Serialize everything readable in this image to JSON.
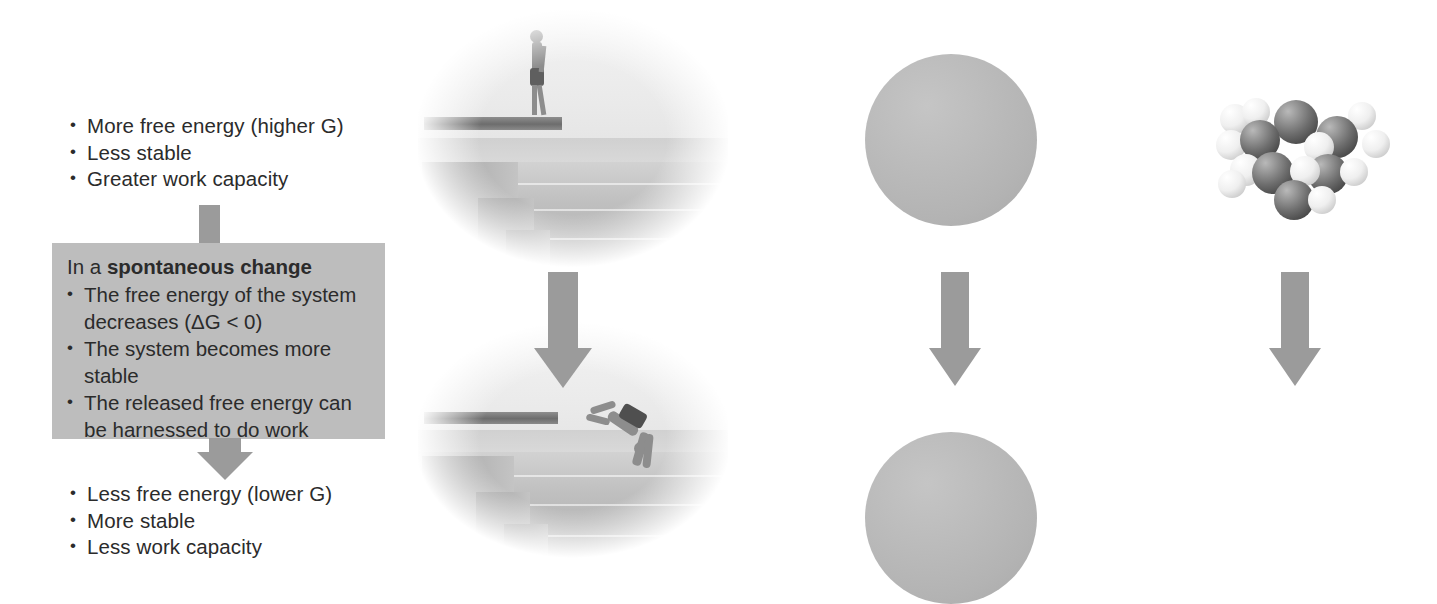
{
  "figure": {
    "colors": {
      "box_fill": "#bdbdbd",
      "arrow_gray": "#9b9b9b",
      "text": "#2b2b2b",
      "particle_dark": "#4e4e4e",
      "carbon_atom": "#2e2e2e",
      "hydrogen_atom": "#ffffff"
    }
  },
  "text_column": {
    "top_list": [
      "More free energy (higher G)",
      "Less stable",
      "Greater work capacity"
    ],
    "top_list_italic_tokens": [
      "G"
    ],
    "box": {
      "heading_prefix": "In a ",
      "heading_bold": "spontaneous change",
      "items": [
        "The free energy of the system decreases (ΔG < 0)",
        "The system becomes more stable",
        "The released free energy can be harnessed to do work"
      ],
      "item_lines": [
        [
          "The free energy of the system",
          "decreases (ΔG < 0)"
        ],
        [
          "The system becomes more",
          "stable"
        ],
        [
          "The released free energy can",
          "be harnessed to do work"
        ]
      ]
    },
    "bottom_list": [
      "Less free energy (lower G)",
      "More stable",
      "Less work capacity"
    ],
    "bottom_list_italic_tokens": [
      "G"
    ]
  },
  "panels": {
    "diver": {
      "name": "diver-illustration",
      "top_caption": "Diver standing on a high platform above steps and water",
      "bottom_caption": "Diver falling from the platform toward the water",
      "arrow": "down-arrow"
    },
    "diffusion": {
      "name": "particle-diffusion-illustration",
      "top_caption": "Particles concentrated in one region of the container",
      "bottom_caption": "Particles dispersed evenly throughout the container",
      "top_particle_count": 10,
      "bottom_particle_count": 10,
      "arrow": "down-arrow"
    },
    "molecules": {
      "name": "molecular-decomposition-illustration",
      "top_caption": "Large ordered space-filling molecule",
      "bottom_caption": "Smaller dispersed product molecules",
      "top_molecule_count": 1,
      "bottom_molecule_count": 6,
      "arrow": "down-arrow"
    }
  },
  "geometry": {
    "diffusion_particles_top": [
      [
        47,
        27
      ],
      [
        82,
        34
      ],
      [
        28,
        52
      ],
      [
        68,
        59
      ],
      [
        50,
        78
      ],
      [
        14,
        84
      ],
      [
        76,
        92
      ],
      [
        47,
        102
      ],
      [
        13,
        110
      ],
      [
        88,
        66
      ]
    ],
    "diffusion_particles_bottom": [
      [
        47,
        28
      ],
      [
        110,
        24
      ],
      [
        72,
        48
      ],
      [
        128,
        58
      ],
      [
        26,
        77
      ],
      [
        63,
        92
      ],
      [
        122,
        100
      ],
      [
        47,
        128
      ],
      [
        97,
        134
      ],
      [
        18,
        114
      ]
    ],
    "bottom_molecules": [
      {
        "x": 14,
        "y": 10,
        "type": "water",
        "scale": 1.0
      },
      {
        "x": 112,
        "y": 22,
        "type": "co2",
        "scale": 1.15
      },
      {
        "x": 0,
        "y": 46,
        "type": "water",
        "scale": 1.0
      },
      {
        "x": 178,
        "y": 48,
        "type": "water",
        "scale": 1.0
      },
      {
        "x": 36,
        "y": 104,
        "type": "co2",
        "scale": 1.1
      },
      {
        "x": 150,
        "y": 122,
        "type": "water",
        "scale": 1.0
      }
    ]
  }
}
